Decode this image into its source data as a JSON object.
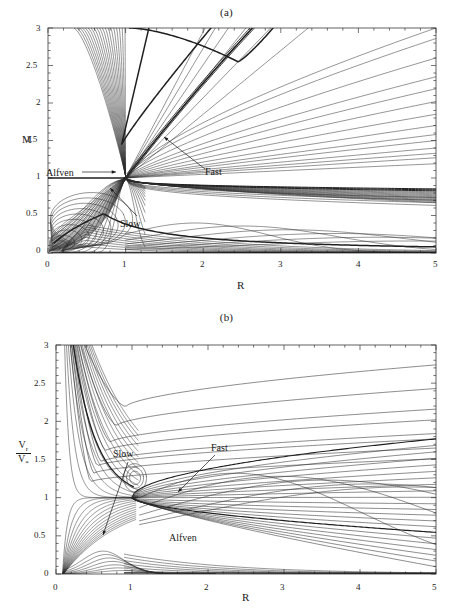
{
  "figure": {
    "type": "contour-phase-plot-figure",
    "panels": [
      {
        "id": "a",
        "title": "(a)",
        "xlabel": "R",
        "ylabel": "M",
        "xticks": [
          "0",
          "1",
          "2",
          "3",
          "4",
          "5"
        ],
        "yticks": [
          "0",
          "0.5",
          "1",
          "1.5",
          "2",
          "2.5",
          "3"
        ],
        "annotations": [
          {
            "label": "Alfven",
            "arrow": "right"
          },
          {
            "label": "Fast",
            "arrow": "up-left"
          },
          {
            "label": "Slow",
            "arrow": "up-left"
          }
        ]
      },
      {
        "id": "b",
        "title": "(b)",
        "xlabel": "R",
        "ylabel_num": "V",
        "ylabel_num_sub": "r",
        "ylabel_den": "V",
        "ylabel_den_sub": "*",
        "xticks": [
          "0",
          "1",
          "2",
          "3",
          "4",
          "5"
        ],
        "yticks": [
          "0",
          "0.5",
          "1",
          "1.5",
          "2",
          "2.5",
          "3"
        ],
        "annotations": [
          {
            "label": "Slow",
            "arrow": "down-left"
          },
          {
            "label": "Fast",
            "arrow": "down-left"
          },
          {
            "label": "Alfven",
            "arrow": "none"
          }
        ]
      }
    ]
  },
  "chart_data": [
    {
      "type": "line",
      "title": "(a)",
      "xlabel": "R",
      "ylabel": "M",
      "xlim": [
        0,
        5
      ],
      "ylim": [
        0,
        3
      ],
      "xticks": [
        0,
        1,
        2,
        3,
        4,
        5
      ],
      "yticks": [
        0,
        0.5,
        1,
        1.5,
        2,
        2.5,
        3
      ],
      "grid": false,
      "legend": "none",
      "description": "Family of MHD wind solution contours (Mach number M vs radius R) crossing at the Alfven point (R=1, M=1). Separatrix branches labelled Slow, Alfven and Fast.",
      "critical_point": {
        "R": 1.0,
        "M": 1.0
      },
      "annotations": [
        {
          "text": "Alfven",
          "x": 0.05,
          "y": 1.0,
          "arrow_to": {
            "x": 0.92,
            "y": 1.0
          }
        },
        {
          "text": "Fast",
          "x": 2.05,
          "y": 1.02,
          "arrow_to": {
            "x": 1.48,
            "y": 1.58
          }
        },
        {
          "text": "Slow",
          "x": 1.0,
          "y": 0.12,
          "arrow_to": {
            "x": 0.66,
            "y": 0.52
          }
        }
      ],
      "series": [
        {
          "name": "fast-separatrix",
          "x": [
            1.0,
            1.5,
            2.0,
            2.5,
            3.0,
            3.4
          ],
          "y": [
            1.0,
            1.62,
            2.1,
            2.48,
            2.8,
            3.0
          ]
        },
        {
          "name": "alfven-separatrix-left",
          "x": [
            0.0,
            0.25,
            0.5,
            0.75,
            1.0
          ],
          "y": [
            1.0,
            1.0,
            1.0,
            1.0,
            1.0
          ]
        },
        {
          "name": "alfven-separatrix-right",
          "x": [
            1.0,
            2.0,
            3.0,
            4.0,
            5.0
          ],
          "y": [
            1.0,
            0.86,
            0.8,
            0.76,
            0.73
          ]
        },
        {
          "name": "slow-separatrix",
          "x": [
            0.1,
            0.4,
            0.7,
            1.0,
            2.0,
            3.0,
            4.0,
            5.0
          ],
          "y": [
            0.08,
            0.38,
            0.52,
            0.47,
            0.25,
            0.13,
            0.07,
            0.03
          ]
        },
        {
          "name": "upper-steep-family",
          "count": 18,
          "note": "steep near-linear curves rising from lower-left toward M=3 between R=0.35 and R=1.0"
        },
        {
          "name": "upper-right-fan",
          "count": 14,
          "note": "near-straight lines fanning from the critical point to the right edge, M between 1.25 and 3.0 at R=5"
        },
        {
          "name": "lower-right-arches",
          "count": 6,
          "note": "nested arches below M=0.6 with maxima between R=1.8 and R=4.6"
        },
        {
          "name": "lower-left-loops",
          "count": 10,
          "note": "small nested loops near R<0.4, M<0.5"
        }
      ]
    },
    {
      "type": "line",
      "title": "(b)",
      "xlabel": "R",
      "ylabel": "Vr/V*",
      "xlim": [
        0,
        5
      ],
      "ylim": [
        0,
        3
      ],
      "xticks": [
        0,
        1,
        2,
        3,
        4,
        5
      ],
      "yticks": [
        0,
        0.5,
        1,
        1.5,
        2,
        2.5,
        3
      ],
      "grid": false,
      "legend": "none",
      "description": "Radial velocity normalised to the characteristic speed V* versus radius R for the same solution family; all branches pass through the critical point (R=1, Vr/V*=1).",
      "critical_point": {
        "R": 1.0,
        "Vr_over_Vstar": 1.0
      },
      "annotations": [
        {
          "text": "Slow",
          "x": 0.78,
          "y": 1.62,
          "arrow_to": {
            "x": 0.6,
            "y": 0.62
          }
        },
        {
          "text": "Fast",
          "x": 2.12,
          "y": 1.72,
          "arrow_to": {
            "x": 1.48,
            "y": 1.22
          }
        },
        {
          "text": "Alfven",
          "x": 1.72,
          "y": 0.45,
          "arrow_to": null
        }
      ],
      "series": [
        {
          "name": "upper-flat-family",
          "count": 8,
          "note": "curves entering from the left wall, flattening and rising gently to the right; right-edge values 2.74, 2.43, 2.16, 2.02, 1.84, 1.77, 1.65, 1.51"
        },
        {
          "name": "right-edge-values",
          "x": 5.0,
          "y": [
            2.74,
            2.43,
            2.16,
            2.02,
            1.84,
            1.77,
            1.65,
            1.51,
            1.4,
            0.91,
            0.72,
            0.68,
            0.35,
            0.27,
            0.02
          ]
        },
        {
          "name": "fast-branch",
          "x": [
            1.0,
            1.5,
            2.0,
            3.0,
            4.0,
            5.0
          ],
          "y": [
            1.0,
            1.22,
            1.35,
            1.55,
            1.68,
            1.77
          ]
        },
        {
          "name": "alfven-branch",
          "x": [
            1.0,
            1.5,
            2.0,
            3.0,
            4.0,
            5.0
          ],
          "y": [
            1.0,
            0.72,
            0.55,
            0.35,
            0.24,
            0.17
          ]
        },
        {
          "name": "slow-branch",
          "x": [
            0.1,
            0.4,
            0.6,
            0.8,
            1.0
          ],
          "y": [
            3.0,
            1.45,
            1.1,
            1.02,
            1.0
          ]
        },
        {
          "name": "steep-left-family",
          "count": 16,
          "note": "steeply descending curves from the top-left wall converging toward the critical point"
        },
        {
          "name": "lower-arches",
          "count": 7,
          "note": "flat arches below Vr/V*=0.35 with maxima between R=0.5 and R=0.9"
        },
        {
          "name": "inner-loop",
          "x": [
            0.95,
            1.05,
            1.12,
            1.05,
            0.95
          ],
          "y": [
            1.25,
            1.42,
            1.28,
            1.12,
            1.25
          ],
          "note": "small closed loop just above the critical point"
        }
      ]
    }
  ]
}
